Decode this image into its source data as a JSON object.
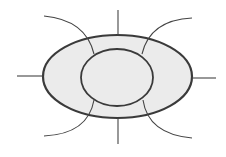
{
  "diagram": {
    "width": 226,
    "height": 157,
    "colors": {
      "background": "#ffffff",
      "fill": "#ebebeb",
      "stroke": "#3a3a3a",
      "spoke": "#444444"
    },
    "outer_ellipse": {
      "cx": 117.5,
      "cy": 76.5,
      "rx": 74.5,
      "ry": 41.5,
      "stroke_width": 2.2
    },
    "inner_ellipse": {
      "cx": 117,
      "cy": 77.5,
      "rx": 36,
      "ry": 28.5,
      "stroke_width": 1.8
    },
    "straight_spokes": [
      {
        "name": "top",
        "x1": 118,
        "y1": 10,
        "x2": 118,
        "y2": 35
      },
      {
        "name": "bottom",
        "x1": 118,
        "y1": 118,
        "x2": 118,
        "y2": 144
      },
      {
        "name": "left",
        "x1": 17,
        "y1": 76,
        "x2": 43,
        "y2": 76
      },
      {
        "name": "right",
        "x1": 192,
        "y1": 78,
        "x2": 216,
        "y2": 78
      }
    ],
    "curved_spokes": [
      {
        "name": "top-left",
        "d": "M44,16 Q86,20 94,54"
      },
      {
        "name": "top-right",
        "d": "M192,18 Q150,20 142,54"
      },
      {
        "name": "bottom-left",
        "d": "M44,136 Q88,134 94,100"
      },
      {
        "name": "bottom-right",
        "d": "M192,138 Q148,134 143,100"
      }
    ]
  }
}
